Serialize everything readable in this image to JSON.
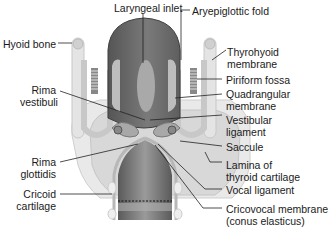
{
  "diagram": {
    "labels": {
      "laryngeal_inlet": "Laryngeal inlet",
      "aryepiglottic_fold": "Aryepiglottic fold",
      "hyoid_bone": "Hyoid bone",
      "thyrohyoid_membrane": [
        "Thyrohyoid",
        "membrane"
      ],
      "piriform_fossa": "Piriform fossa",
      "rima_vestibuli": [
        "Rima",
        "vestibuli"
      ],
      "quadrangular_membrane": [
        "Quadrangular",
        "membrane"
      ],
      "vestibular_ligament": [
        "Vestibular",
        "ligament"
      ],
      "saccule": "Saccule",
      "rima_glottidis": [
        "Rima",
        "glottidis"
      ],
      "lamina_thyroid": [
        "Lamina of",
        "thyroid cartilage"
      ],
      "vocal_ligament": "Vocal ligament",
      "cricoid_cartilage": [
        "Cricoid",
        "cartilage"
      ],
      "cricovocal_membrane": [
        "Cricovocal membrane",
        "(conus elasticus)"
      ]
    },
    "colors": {
      "cartilage": "#e6e6e6",
      "tissue": "#d4d4d4",
      "lumen_dark": "#6e6e6e",
      "lumen_mid": "#9a9a9a",
      "leader_line": "#222222"
    }
  }
}
